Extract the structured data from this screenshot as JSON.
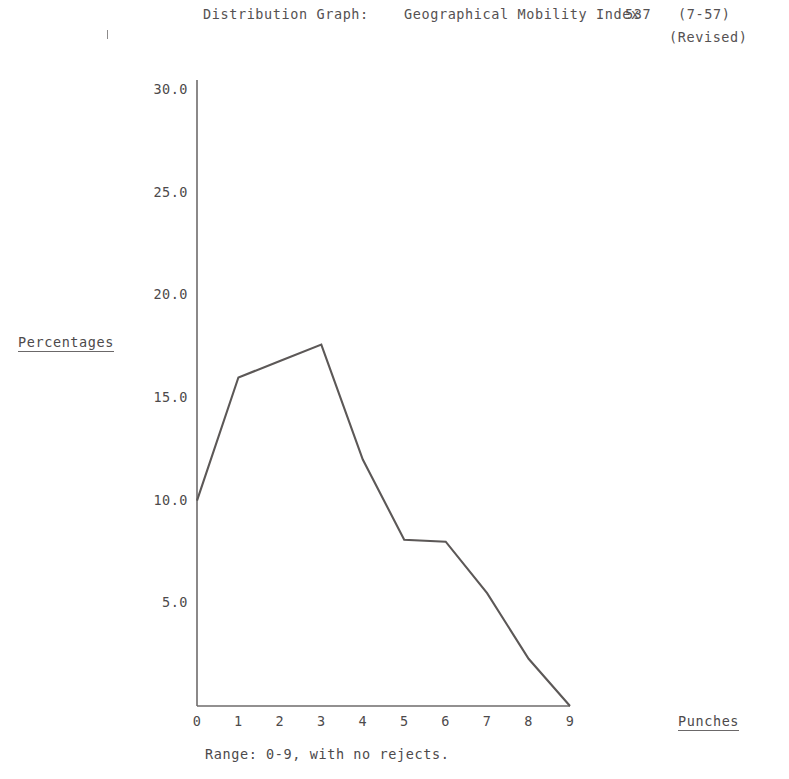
{
  "header": {
    "label": "Distribution Graph:",
    "index_title": "Geographical Mobility Index",
    "index_number": "537",
    "date_code": "(7-57)",
    "revision": "(Revised)"
  },
  "axes": {
    "y_caption": "Percentages",
    "x_caption": "Punches"
  },
  "footnote": "Range: 0-9, with no rejects.",
  "chart_data": {
    "type": "line",
    "title": "Distribution Graph:   Geographical Mobility Index  537  (7-57)",
    "subtitle": "(Revised)",
    "xlabel": "Punches",
    "ylabel": "Percentages",
    "x": [
      0,
      1,
      2,
      3,
      4,
      5,
      6,
      7,
      8,
      9
    ],
    "values": [
      10.0,
      16.0,
      16.8,
      17.6,
      12.0,
      8.1,
      8.0,
      5.5,
      2.3,
      0.0
    ],
    "xtick_labels": [
      "0",
      "1",
      "2",
      "3",
      "4",
      "5",
      "6",
      "7",
      "8",
      "9"
    ],
    "ytick_labels": [
      "5.0",
      "10.0",
      "15.0",
      "20.0",
      "25.0",
      "30.0"
    ],
    "ytick_values": [
      5.0,
      10.0,
      15.0,
      20.0,
      25.0,
      30.0
    ],
    "xlim": [
      0,
      9
    ],
    "ylim": [
      0,
      32
    ],
    "grid": false,
    "legend": null,
    "line_color": "#5c5857",
    "axis_color": "#6e6b6b",
    "note": "Range: 0-9, with no rejects."
  }
}
